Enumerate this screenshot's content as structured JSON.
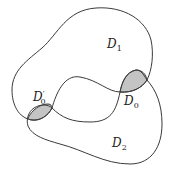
{
  "diagram": {
    "type": "set-diagram",
    "colors": {
      "stroke": "#3a3a3a",
      "shade": "#c4c4c4",
      "background": "#ffffff"
    },
    "regions": [
      {
        "id": "D1",
        "base": "D",
        "subscript": "1",
        "prime": ""
      },
      {
        "id": "D2",
        "base": "D",
        "subscript": "2",
        "prime": ""
      },
      {
        "id": "D0",
        "base": "D",
        "subscript": "0",
        "prime": ""
      },
      {
        "id": "D0prime",
        "base": "D",
        "subscript": "0",
        "prime": "′"
      }
    ]
  }
}
